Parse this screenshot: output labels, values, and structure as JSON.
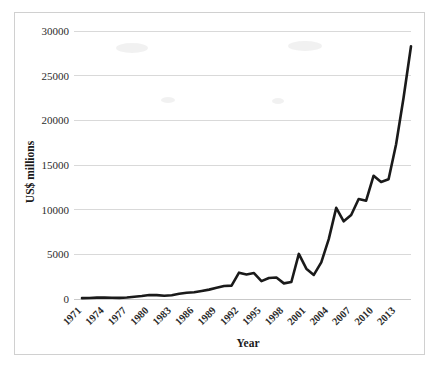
{
  "chart_data": {
    "type": "line",
    "title": "",
    "xlabel": "Year",
    "ylabel": "US$ millions",
    "xlim": [
      1971,
      2015
    ],
    "ylim": [
      0,
      30000
    ],
    "grid": true,
    "legend": false,
    "ytick_labels": [
      "0",
      "5000",
      "10000",
      "15000",
      "20000",
      "25000",
      "30000"
    ],
    "ytick_values": [
      0,
      5000,
      10000,
      15000,
      20000,
      25000,
      30000
    ],
    "xtick_labels": [
      "1971",
      "1974",
      "1977",
      "1980",
      "1983",
      "1986",
      "1989",
      "1992",
      "1995",
      "1998",
      "2001",
      "2004",
      "2007",
      "2010",
      "2013"
    ],
    "xtick_values": [
      1971,
      1974,
      1977,
      1980,
      1983,
      1986,
      1989,
      1992,
      1995,
      1998,
      2001,
      2004,
      2007,
      2010,
      2013
    ],
    "series": [
      {
        "name": "US$ millions",
        "color": "#1a1a1a",
        "x": [
          1971,
          1972,
          1973,
          1974,
          1975,
          1976,
          1977,
          1978,
          1979,
          1980,
          1981,
          1982,
          1983,
          1984,
          1985,
          1986,
          1987,
          1988,
          1989,
          1990,
          1991,
          1992,
          1993,
          1994,
          1995,
          1996,
          1997,
          1998,
          1999,
          2000,
          2001,
          2002,
          2003,
          2004,
          2005,
          2006,
          2007,
          2008,
          2009,
          2010,
          2011,
          2012,
          2013,
          2014,
          2015
        ],
        "values": [
          100,
          120,
          150,
          160,
          140,
          130,
          160,
          260,
          330,
          450,
          430,
          360,
          420,
          580,
          700,
          760,
          900,
          1050,
          1250,
          1450,
          1500,
          2950,
          2750,
          2900,
          2000,
          2350,
          2400,
          1750,
          1900,
          5050,
          3400,
          2700,
          4100,
          6700,
          10200,
          8700,
          9400,
          11200,
          11000,
          13800,
          13100,
          13400,
          17300,
          22500,
          28300
        ]
      }
    ]
  },
  "axis": {
    "y_title": "US$ millions",
    "x_title": "Year"
  }
}
